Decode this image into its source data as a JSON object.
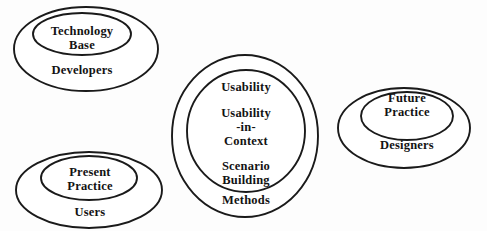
{
  "diagram": {
    "background_color": "#fdfdfd",
    "stroke_color": "#1a1a1a",
    "text_color": "#131313",
    "groups": [
      {
        "id": "developers-group",
        "outer_label": "Developers",
        "inner_label_line1": "Technology",
        "inner_label_line2": "Base"
      },
      {
        "id": "users-group",
        "outer_label": "Users",
        "inner_label_line1": "Present",
        "inner_label_line2": "Practice"
      },
      {
        "id": "methods-group",
        "outer_label": "Methods",
        "inner_label_1": "Usability",
        "inner_label_2_line1": "Usability",
        "inner_label_2_line2": "-in-",
        "inner_label_2_line3": "Context",
        "inner_label_3_line1": "Scenario",
        "inner_label_3_line2": "Building"
      },
      {
        "id": "designers-group",
        "outer_label": "Designers",
        "inner_label_line1": "Future",
        "inner_label_line2": "Practice"
      }
    ]
  }
}
